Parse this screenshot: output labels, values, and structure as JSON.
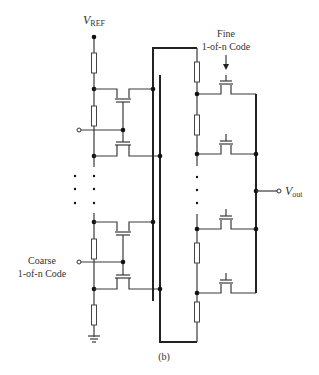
{
  "diagram": {
    "type": "circuit",
    "caption": "(b)",
    "labels": {
      "vref_main": "V",
      "vref_sub": "REF",
      "vout_main": "V",
      "vout_sub": "out",
      "fine_line1": "Fine",
      "fine_line2": "1-of-n Code",
      "coarse_line1": "Coarse",
      "coarse_line2": "1-of-n Code"
    },
    "ellipsis": "⋮"
  }
}
